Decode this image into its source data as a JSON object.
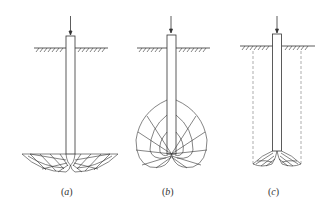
{
  "figure": {
    "panels": [
      {
        "id": "a",
        "label_open": "(",
        "label_letter": "a",
        "label_close": ")",
        "failure_mode": "general shear below pile tip"
      },
      {
        "id": "b",
        "label_open": "(",
        "label_letter": "b",
        "label_close": ")",
        "failure_mode": "bulb-shaped shear zone around pile base"
      },
      {
        "id": "c",
        "label_open": "(",
        "label_letter": "c",
        "label_close": ")",
        "failure_mode": "punching shear with dashed vertical slip surfaces"
      }
    ],
    "colors": {
      "line": "#333333",
      "dashed": "#777777",
      "background": "#ffffff"
    }
  }
}
